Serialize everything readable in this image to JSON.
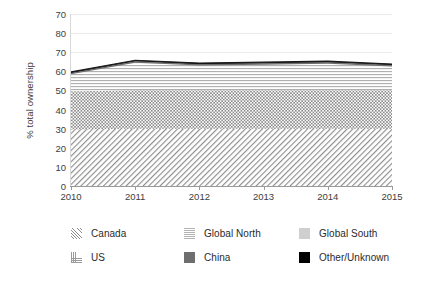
{
  "chart_data": {
    "type": "area",
    "stacked": true,
    "title": "",
    "xlabel": "",
    "ylabel": "% total ownership",
    "x": [
      2010,
      2011,
      2012,
      2013,
      2014,
      2015
    ],
    "xtick_labels": [
      "2010",
      "2011",
      "2012",
      "2013",
      "2014",
      "2015"
    ],
    "xlim": [
      2010,
      2015
    ],
    "ytick_labels": [
      "70",
      "80",
      "70",
      "60",
      "50",
      "40",
      "30",
      "20",
      "10",
      "0"
    ],
    "ytick_values": [
      90,
      80,
      70,
      60,
      50,
      40,
      30,
      20,
      10,
      0
    ],
    "ylim": [
      0,
      90
    ],
    "grid": "horizontal",
    "legend_position": "bottom",
    "series": [
      {
        "name": "Canada",
        "pattern": "diagonal-hatch",
        "color": "#8e8e8e",
        "values": [
          29.5,
          30.0,
          30.0,
          30.0,
          30.0,
          30.0
        ]
      },
      {
        "name": "US",
        "pattern": "checker-dots",
        "color": "#9a9a9a",
        "values": [
          20.0,
          20.0,
          20.0,
          20.0,
          20.0,
          20.0
        ]
      },
      {
        "name": "Global South",
        "pattern": "solid-light-gray",
        "color": "#cfcfcf",
        "values": [
          0.0,
          0.0,
          0.0,
          0.0,
          0.0,
          0.0
        ]
      },
      {
        "name": "Global North",
        "pattern": "horizontal-stripes",
        "color": "#b3b3b3",
        "values": [
          9.0,
          14.5,
          13.0,
          13.5,
          14.0,
          12.5
        ]
      },
      {
        "name": "China",
        "pattern": "solid-dark-gray",
        "color": "#6e6e6e",
        "values": [
          0.8,
          0.9,
          0.9,
          0.9,
          0.9,
          0.9
        ]
      },
      {
        "name": "Other/Unknown",
        "pattern": "solid-black",
        "color": "#000000",
        "values": [
          0.4,
          0.4,
          0.4,
          0.4,
          0.4,
          0.4
        ]
      }
    ],
    "stack_tops": {
      "Canada": [
        29.5,
        30.0,
        30.0,
        30.0,
        30.0,
        30.0
      ],
      "US": [
        49.5,
        50.0,
        50.0,
        50.0,
        50.0,
        50.0
      ],
      "Global South": [
        49.5,
        50.0,
        50.0,
        50.0,
        50.0,
        50.0
      ],
      "Global North": [
        58.5,
        64.5,
        63.0,
        63.5,
        64.0,
        62.5
      ],
      "China": [
        59.3,
        65.4,
        63.9,
        64.4,
        64.9,
        63.4
      ],
      "Other/Unknown": [
        59.7,
        65.8,
        64.3,
        64.8,
        65.3,
        63.8
      ]
    }
  },
  "legend": {
    "row1": [
      {
        "label": "Canada",
        "swatch": "canada-swatch"
      },
      {
        "label": "Global North",
        "swatch": "global-north-swatch"
      },
      {
        "label": "Global South",
        "swatch": "global-south-swatch"
      }
    ],
    "row2": [
      {
        "label": "US",
        "swatch": "us-swatch"
      },
      {
        "label": "China",
        "swatch": "china-swatch"
      },
      {
        "label": "Other/Unknown",
        "swatch": "other-unknown-swatch"
      }
    ]
  }
}
